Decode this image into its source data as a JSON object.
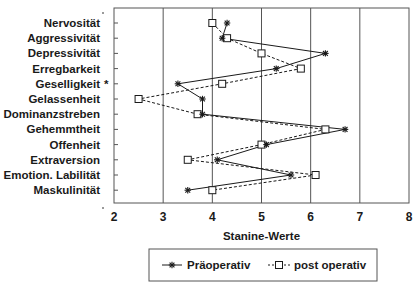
{
  "chart_data": {
    "type": "line",
    "orientation": "horizontal-profile",
    "title": "",
    "xlabel": "Stanine-Werte",
    "ylabel": "",
    "xlim": [
      2,
      8
    ],
    "x_ticks": [
      "2",
      "3",
      "4",
      "5",
      "6",
      "7",
      "8"
    ],
    "grid": "vertical",
    "categories": [
      "Nervosität",
      "Aggressivität",
      "Depressivität",
      "Erregbarkeit",
      "Geselligkeit",
      "Gelassenheit",
      "Dominanzstreben",
      "Gehemmtheit",
      "Offenheit",
      "Extraversion",
      "Emotion. Labilität",
      "Maskulinität"
    ],
    "category_markers": [
      "",
      "",
      "",
      "",
      "*",
      "",
      "",
      "",
      "",
      "",
      "",
      ""
    ],
    "series": [
      {
        "name": "Präoperativ",
        "line_style": "solid",
        "marker": "asterisk",
        "values": [
          4.3,
          4.2,
          6.3,
          5.3,
          3.3,
          3.8,
          3.8,
          6.7,
          5.1,
          4.1,
          5.6,
          3.5
        ]
      },
      {
        "name": "post operativ",
        "line_style": "dashed",
        "marker": "square",
        "values": [
          4.0,
          4.3,
          5.0,
          5.8,
          4.2,
          2.5,
          3.7,
          6.3,
          5.0,
          3.5,
          6.1,
          4.0
        ]
      }
    ],
    "legend_position": "bottom-center"
  },
  "colors": {
    "ink": "#1a1a1a",
    "grid": "#555555",
    "background": "#ffffff"
  }
}
